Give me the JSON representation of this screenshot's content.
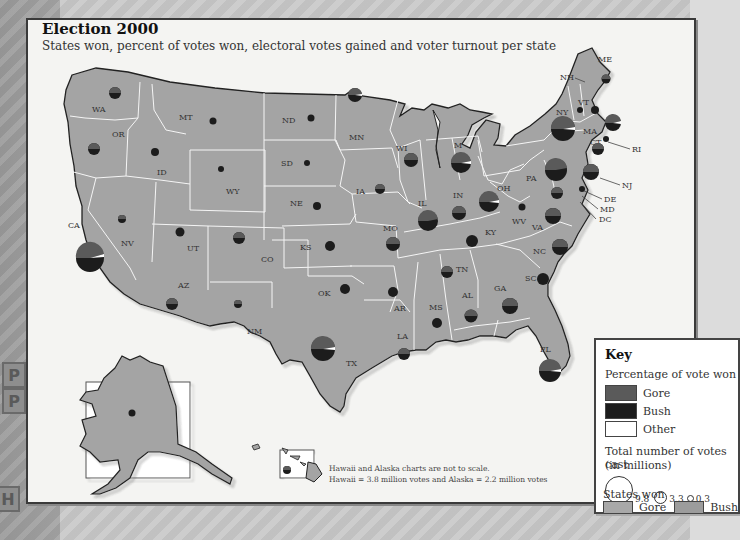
{
  "header": {
    "title": "Election 2000",
    "subtitle": "States won, percent of votes won, electoral votes gained and voter turnout per state"
  },
  "background": {
    "street_labels": [
      "P",
      "P",
      "H",
      "S"
    ]
  },
  "colors": {
    "gore_pie": "#5a5a5a",
    "bush_pie": "#1c1c1c",
    "other_pie": "#ffffff",
    "gore_state": "#a8a8a8",
    "bush_state": "#9c9c9c",
    "state_border": "#ffffff",
    "coast": "#222222"
  },
  "states": [
    {
      "code": "WA",
      "label": "WA"
    },
    {
      "code": "OR",
      "label": "OR"
    },
    {
      "code": "CA",
      "label": "CA"
    },
    {
      "code": "NV",
      "label": "NV"
    },
    {
      "code": "ID",
      "label": "ID"
    },
    {
      "code": "MT",
      "label": "MT"
    },
    {
      "code": "WY",
      "label": "WY"
    },
    {
      "code": "UT",
      "label": "UT"
    },
    {
      "code": "AZ",
      "label": "AZ"
    },
    {
      "code": "CO",
      "label": "CO"
    },
    {
      "code": "NM",
      "label": "NM"
    },
    {
      "code": "ND",
      "label": "ND"
    },
    {
      "code": "SD",
      "label": "SD"
    },
    {
      "code": "NE",
      "label": "NE"
    },
    {
      "code": "KS",
      "label": "KS"
    },
    {
      "code": "OK",
      "label": "OK"
    },
    {
      "code": "TX",
      "label": "TX"
    },
    {
      "code": "MN",
      "label": "MN"
    },
    {
      "code": "IA",
      "label": "IA"
    },
    {
      "code": "MO",
      "label": "MO"
    },
    {
      "code": "AR",
      "label": "AR"
    },
    {
      "code": "LA",
      "label": "LA"
    },
    {
      "code": "WI",
      "label": "WI"
    },
    {
      "code": "IL",
      "label": "IL"
    },
    {
      "code": "MI",
      "label": "M"
    },
    {
      "code": "IN",
      "label": "IN"
    },
    {
      "code": "OH",
      "label": "OH"
    },
    {
      "code": "KY",
      "label": "KY"
    },
    {
      "code": "TN",
      "label": "TN"
    },
    {
      "code": "MS",
      "label": "MS"
    },
    {
      "code": "AL",
      "label": "AL"
    },
    {
      "code": "GA",
      "label": "GA"
    },
    {
      "code": "FL",
      "label": "FL"
    },
    {
      "code": "SC",
      "label": "SC"
    },
    {
      "code": "NC",
      "label": "NC"
    },
    {
      "code": "VA",
      "label": "VA"
    },
    {
      "code": "WV",
      "label": "WV"
    },
    {
      "code": "PA",
      "label": "PA"
    },
    {
      "code": "NY",
      "label": "NY"
    },
    {
      "code": "VT",
      "label": "VT"
    },
    {
      "code": "NH",
      "label": "NH"
    },
    {
      "code": "ME",
      "label": "ME"
    },
    {
      "code": "MA",
      "label": "MA"
    },
    {
      "code": "CT",
      "label": "CT"
    },
    {
      "code": "RI",
      "label": "RI"
    },
    {
      "code": "NJ",
      "label": "NJ"
    },
    {
      "code": "DE",
      "label": "DE"
    },
    {
      "code": "MD",
      "label": "MD"
    },
    {
      "code": "DC",
      "label": "DC"
    }
  ],
  "note": {
    "line1": "Hawaii and Alaska charts are not to scale.",
    "line2": "Hawaii = 3.8 million votes and Alaska = 2.2  million votes"
  },
  "key": {
    "title": "Key",
    "pct_heading": "Percentage of vote won",
    "pct_items": [
      {
        "label": "Gore"
      },
      {
        "label": "Bush"
      },
      {
        "label": "Other"
      }
    ],
    "size_heading_1": "Total number of votes cast",
    "size_heading_2": "(in millions)",
    "size_values": [
      "9.8",
      "3.3",
      "0.3"
    ],
    "won_heading": "States won",
    "won_items": [
      {
        "label": "Gore"
      },
      {
        "label": "Bush"
      }
    ]
  }
}
